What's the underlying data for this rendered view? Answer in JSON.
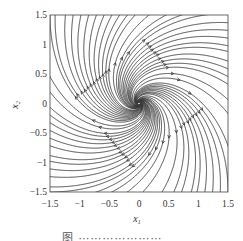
{
  "chart_data": {
    "type": "streamplot",
    "title": "",
    "xlabel": "x1",
    "ylabel": "x2",
    "xlim": [
      -1.5,
      1.5
    ],
    "ylim": [
      -1.5,
      1.5
    ],
    "x_ticks": [
      "−1.5",
      "−1",
      "−0.5",
      "0",
      "0.5",
      "1",
      "1.5"
    ],
    "y_ticks": [
      "1.5",
      "1",
      "0.5",
      "0",
      "−0.5",
      "−1",
      "−1.5"
    ],
    "grid": false,
    "legend": null,
    "vector_field": {
      "a": 1.0,
      "b": 1.0,
      "c": -1.0,
      "d": 1.0,
      "equation": "dx1/dt = a*x1 + b*x2, dx2/dt = c*x1 + d*x2"
    },
    "equilibrium": {
      "x": 0,
      "y": 0,
      "type": "unstable spiral"
    }
  },
  "axes": {
    "xlabel_main": "x",
    "xlabel_sub": "1",
    "ylabel_main": "x",
    "ylabel_sub": "2"
  },
  "caption": "图 ⋯⋯⋯⋯⋯⋯⋯"
}
